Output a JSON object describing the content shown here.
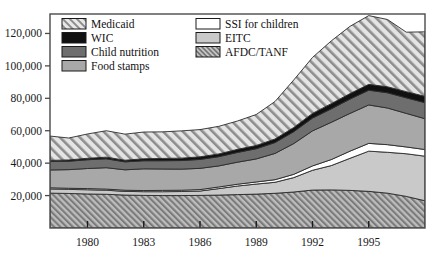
{
  "chart_data": {
    "type": "area",
    "title": "",
    "subtitle": "",
    "xlabel": "",
    "ylabel": "",
    "stacked": true,
    "grid": false,
    "legend_position": "top-left-inside",
    "xlim": [
      1978,
      1998
    ],
    "ylim": [
      0,
      132000
    ],
    "x_ticks": [
      1980,
      1983,
      1986,
      1989,
      1992,
      1995
    ],
    "x_tick_labels": [
      "1980",
      "1983",
      "1986",
      "1989",
      "1992",
      "1995"
    ],
    "y_ticks": [
      20000,
      40000,
      60000,
      80000,
      100000,
      120000
    ],
    "y_tick_labels": [
      "20,000",
      "40,000",
      "60,000",
      "80,000",
      "100,000",
      "120,000"
    ],
    "x": [
      1978,
      1979,
      1980,
      1981,
      1982,
      1983,
      1984,
      1985,
      1986,
      1987,
      1988,
      1989,
      1990,
      1991,
      1992,
      1993,
      1994,
      1995,
      1996,
      1997,
      1998
    ],
    "series": [
      {
        "name": "AFDC/TANF",
        "order": 1,
        "fill": "#9a9a9a",
        "pattern": "diagonal-hatch-dense",
        "values": [
          21500,
          21300,
          21000,
          20800,
          20300,
          20100,
          20000,
          20000,
          20100,
          20300,
          20600,
          20900,
          21400,
          22200,
          23400,
          23500,
          23200,
          22600,
          21500,
          19500,
          16800
        ]
      },
      {
        "name": "EITC",
        "order": 2,
        "fill": "#c9c9c9",
        "pattern": "solid",
        "values": [
          2600,
          2500,
          2600,
          2500,
          2300,
          2300,
          2400,
          2500,
          2700,
          4000,
          5300,
          6200,
          6800,
          8900,
          12200,
          15000,
          19800,
          24800,
          25200,
          26300,
          27500
        ]
      },
      {
        "name": "SSI for children",
        "order": 3,
        "fill": "#ffffff",
        "pattern": "solid",
        "values": [
          700,
          700,
          700,
          700,
          700,
          700,
          800,
          800,
          900,
          1000,
          1100,
          1300,
          1600,
          2000,
          2700,
          3700,
          4400,
          4800,
          4700,
          4200,
          4100
        ]
      },
      {
        "name": "Food stamps",
        "order": 4,
        "fill": "#a8a8a8",
        "pattern": "solid",
        "values": [
          11000,
          11500,
          12400,
          13200,
          12600,
          13400,
          13200,
          13000,
          13100,
          13000,
          13600,
          14200,
          16200,
          19000,
          21600,
          23000,
          23300,
          23700,
          22600,
          20700,
          19000
        ]
      },
      {
        "name": "Child nutrition",
        "order": 5,
        "fill": "#6e6e6e",
        "pattern": "solid",
        "values": [
          5300,
          5200,
          5400,
          5500,
          4900,
          5000,
          5100,
          5300,
          5500,
          5700,
          6000,
          6300,
          6700,
          7300,
          7900,
          8300,
          8800,
          9100,
          9400,
          9600,
          9900
        ]
      },
      {
        "name": "WIC",
        "order": 6,
        "fill": "#111111",
        "pattern": "solid",
        "values": [
          600,
          800,
          900,
          1000,
          1000,
          1200,
          1400,
          1500,
          1600,
          1700,
          1900,
          2000,
          2200,
          2600,
          2900,
          3200,
          3400,
          3600,
          3700,
          3800,
          3900
        ]
      },
      {
        "name": "Medicaid",
        "order": 7,
        "fill": "#d6d6d6",
        "pattern": "diagonal-hatch",
        "values": [
          15000,
          13500,
          15000,
          16300,
          16100,
          16500,
          16400,
          16800,
          16800,
          17000,
          17500,
          19100,
          23100,
          29300,
          34500,
          38700,
          41500,
          42400,
          41500,
          36700,
          39800
        ]
      }
    ]
  },
  "legend": {
    "items": [
      {
        "label": "Medicaid",
        "swatch": "diagonal-hatch",
        "column": 1
      },
      {
        "label": "WIC",
        "swatch": "solid-black",
        "column": 1
      },
      {
        "label": "Child nutrition",
        "swatch": "solid-dark-gray",
        "column": 1
      },
      {
        "label": "Food stamps",
        "swatch": "solid-medium-gray",
        "column": 1
      },
      {
        "label": "SSI for children",
        "swatch": "solid-white",
        "column": 2
      },
      {
        "label": "EITC",
        "swatch": "solid-light-gray",
        "column": 2
      },
      {
        "label": "AFDC/TANF",
        "swatch": "diagonal-hatch-dense",
        "column": 2
      }
    ]
  },
  "colors": {
    "medicaid": "#d6d6d6",
    "wic": "#111111",
    "child_nutrition": "#6e6e6e",
    "food_stamps": "#a8a8a8",
    "ssi": "#ffffff",
    "eitc": "#c9c9c9",
    "afdc": "#9a9a9a",
    "axis": "#4a4a4a",
    "text": "#1a1a1a"
  }
}
